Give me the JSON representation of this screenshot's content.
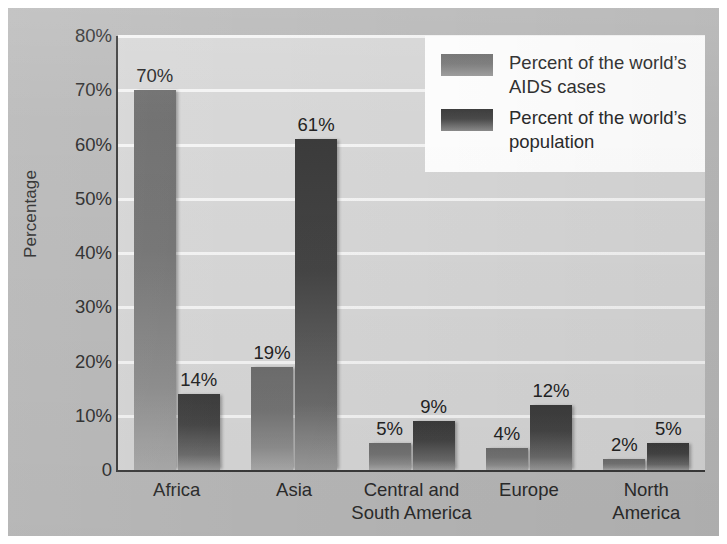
{
  "chart_data": {
    "type": "bar",
    "title": "",
    "xlabel": "",
    "ylabel": "Percentage",
    "ylim": [
      0,
      80
    ],
    "grid": true,
    "legend_position": "top-right",
    "categories": [
      "Africa",
      "Central and\nSouth America",
      "Asia",
      "Europe",
      "North\nAmerica"
    ],
    "category_labels": [
      {
        "lines": [
          "Africa"
        ]
      },
      {
        "lines": [
          "Asia"
        ]
      },
      {
        "lines": [
          "Central and",
          "South America"
        ]
      },
      {
        "lines": [
          "Europe"
        ]
      },
      {
        "lines": [
          "North",
          "America"
        ]
      }
    ],
    "series": [
      {
        "name": "Percent of the world’s AIDS cases",
        "name_lines": [
          "Percent of the world’s",
          "AIDS cases"
        ],
        "color": "#747474",
        "values": [
          70,
          19,
          5,
          4,
          2
        ],
        "value_labels": [
          "70%",
          "19%",
          "5%",
          "4%",
          "2%"
        ]
      },
      {
        "name": "Percent of the world’s population",
        "name_lines": [
          "Percent of the world’s",
          "population"
        ],
        "color": "#454545",
        "values": [
          14,
          61,
          9,
          12,
          5
        ],
        "value_labels": [
          "14%",
          "61%",
          "9%",
          "12%",
          "5%"
        ]
      }
    ],
    "yticks": [
      0,
      10,
      20,
      30,
      40,
      50,
      60,
      70,
      80
    ],
    "ytick_labels": [
      "0",
      "10%",
      "20%",
      "30%",
      "40%",
      "50%",
      "60%",
      "70%",
      "80%"
    ]
  },
  "colors": {
    "page_background": "#b9b9b9",
    "plot_background": "#d7d7d7",
    "gridline": "#f4f4f4",
    "axis": "#3a3a3a",
    "legend_background": "#ffffff",
    "text": "#2b2b2b"
  }
}
